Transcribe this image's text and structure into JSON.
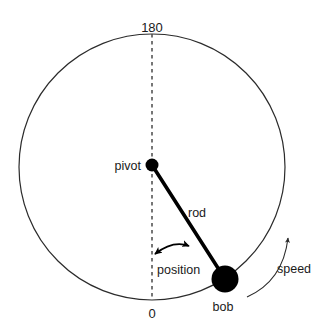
{
  "diagram": {
    "colors": {
      "stroke": "#2b2b2b",
      "fill_black": "#000000",
      "background": "#ffffff",
      "thin_stroke": "#3a3a3a"
    },
    "circle": {
      "center_x": 152,
      "center_y": 167,
      "radius": 133,
      "stroke_width": 1.2
    },
    "axis": {
      "dashed_line_x": 152,
      "top_y": 34,
      "bottom_y": 300,
      "top_label": "180",
      "bottom_label": "0"
    },
    "pivot": {
      "label": "pivot",
      "x": 152,
      "y": 165,
      "radius": 6.5,
      "label_x": 108,
      "label_y": 171
    },
    "bob": {
      "label": "bob",
      "x": 225,
      "y": 279,
      "radius": 13.5,
      "label_x": 211,
      "label_y": 311
    },
    "rod": {
      "label": "rod",
      "x1": 152,
      "y1": 165,
      "x2": 225,
      "y2": 279,
      "stroke_width": 3.6,
      "label_x": 188,
      "label_y": 217
    },
    "position_arc": {
      "label": "position",
      "label_x": 157,
      "label_y": 274,
      "description": "double-headed curved arrow indicating angular position",
      "path": "M 153 255 Q 172 240 190 246",
      "arrowhead_start": "left",
      "arrowhead_end": "right"
    },
    "speed_arc": {
      "label": "speed",
      "label_x": 277,
      "label_y": 273,
      "description": "curved arrow outside circle indicating direction of angular speed",
      "path": "M 247 296 Q 281 282 288 236",
      "arrowhead": "end"
    }
  }
}
